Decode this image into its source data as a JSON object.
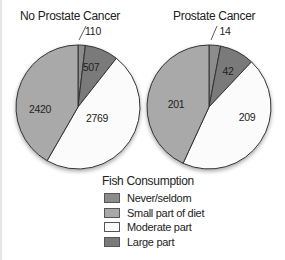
{
  "chart_data": [
    {
      "type": "pie",
      "title": "No Prostate Cancer",
      "categories": [
        "Never/seldom",
        "Large part",
        "Moderate part",
        "Small part of diet"
      ],
      "values": [
        110,
        507,
        2769,
        2420
      ],
      "start": "top, clockwise"
    },
    {
      "type": "pie",
      "title": "Prostate Cancer",
      "categories": [
        "Never/seldom",
        "Large part",
        "Moderate part",
        "Small part of diet"
      ],
      "values": [
        14,
        42,
        209,
        201
      ],
      "start": "top, clockwise"
    }
  ],
  "left": {
    "title": "No Prostate Cancer",
    "labels": {
      "never": "110",
      "large": "507",
      "moderate": "2769",
      "small": "2420"
    }
  },
  "right": {
    "title": "Prostate Cancer",
    "labels": {
      "never": "14",
      "large": "42",
      "moderate": "209",
      "small": "201"
    }
  },
  "legend": {
    "title": "Fish Consumption",
    "items": [
      {
        "label": "Never/seldom",
        "color": "#8c8c8c"
      },
      {
        "label": "Small part of diet",
        "color": "#a9a9a9"
      },
      {
        "label": "Moderate part",
        "color": "#fbfbfb"
      },
      {
        "label": "Large part",
        "color": "#7a7a7a"
      }
    ]
  },
  "colors": {
    "never": "#8c8c8c",
    "small": "#a9a9a9",
    "moderate": "#fbfbfb",
    "large": "#7a7a7a",
    "stroke": "#333333"
  }
}
